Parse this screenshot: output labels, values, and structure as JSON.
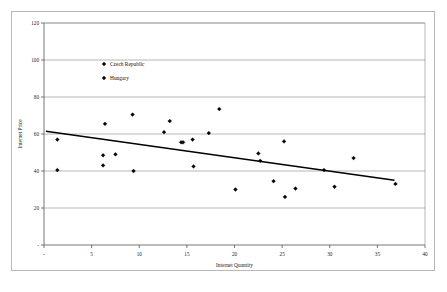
{
  "chart_data": {
    "type": "scatter",
    "title": "",
    "xlabel": "Internet Quantity",
    "ylabel": "Internet Price",
    "xlim": [
      0,
      40
    ],
    "ylim": [
      0,
      120
    ],
    "xticks": [
      "-",
      "5",
      "10",
      "15",
      "20",
      "25",
      "30",
      "35",
      "40"
    ],
    "xtick_values": [
      0,
      5,
      10,
      15,
      20,
      25,
      30,
      35,
      40
    ],
    "yticks": [
      "-",
      "20",
      "40",
      "60",
      "80",
      "100",
      "120"
    ],
    "ytick_values": [
      0,
      20,
      40,
      60,
      80,
      100,
      120
    ],
    "grid": "horizontal",
    "legend_position": "inside-upper-left",
    "legend": [
      {
        "name": "Czech Republic",
        "marker": "diamond",
        "color": "#000000"
      },
      {
        "name": "Hungary",
        "marker": "diamond",
        "color": "#000000"
      }
    ],
    "series": [
      {
        "name": "Czech Republic",
        "marker": "diamond",
        "color": "#000000",
        "points": [
          {
            "x": 1.4,
            "y": 57.0
          },
          {
            "x": 1.4,
            "y": 40.5
          },
          {
            "x": 6.2,
            "y": 48.5
          },
          {
            "x": 6.2,
            "y": 43.0
          },
          {
            "x": 6.4,
            "y": 65.5
          },
          {
            "x": 7.5,
            "y": 49.0
          },
          {
            "x": 9.3,
            "y": 70.5
          },
          {
            "x": 9.4,
            "y": 40.0
          },
          {
            "x": 12.6,
            "y": 61.0
          },
          {
            "x": 13.2,
            "y": 67.0
          },
          {
            "x": 14.4,
            "y": 55.5
          },
          {
            "x": 14.6,
            "y": 55.5
          },
          {
            "x": 15.6,
            "y": 57.0
          },
          {
            "x": 15.7,
            "y": 42.5
          },
          {
            "x": 17.3,
            "y": 60.5
          },
          {
            "x": 18.4,
            "y": 73.5
          }
        ]
      },
      {
        "name": "Hungary",
        "marker": "diamond",
        "color": "#000000",
        "points": [
          {
            "x": 20.1,
            "y": 30.0
          },
          {
            "x": 22.5,
            "y": 49.5
          },
          {
            "x": 22.7,
            "y": 45.5
          },
          {
            "x": 24.1,
            "y": 34.5
          },
          {
            "x": 25.2,
            "y": 56.0
          },
          {
            "x": 25.3,
            "y": 26.0
          },
          {
            "x": 26.4,
            "y": 30.5
          },
          {
            "x": 29.4,
            "y": 40.5
          },
          {
            "x": 30.5,
            "y": 31.5
          },
          {
            "x": 32.5,
            "y": 47.0
          },
          {
            "x": 36.9,
            "y": 33.0
          }
        ]
      }
    ],
    "trendline": {
      "name": "linear-trend",
      "color": "#000000",
      "x_start": 0.2,
      "y_start": 61.5,
      "x_end": 36.8,
      "y_end": 35.0
    }
  }
}
